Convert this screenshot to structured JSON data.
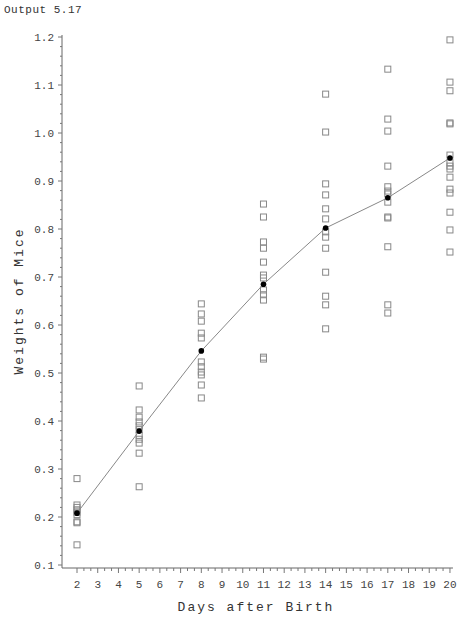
{
  "output_label": "Output 5.17",
  "chart_data": {
    "type": "scatter",
    "title": "",
    "xlabel": "Days after Birth",
    "ylabel": "Weights of Mice",
    "xlim": [
      2,
      20
    ],
    "ylim": [
      0.1,
      1.2
    ],
    "x_ticks": [
      2,
      3,
      4,
      5,
      6,
      7,
      8,
      9,
      10,
      11,
      12,
      13,
      14,
      15,
      16,
      17,
      18,
      19,
      20
    ],
    "y_ticks": [
      0.1,
      0.2,
      0.3,
      0.4,
      0.5,
      0.6,
      0.7,
      0.8,
      0.9,
      1.0,
      1.1,
      1.2
    ],
    "y_tick_labels": [
      "0.1",
      "0.2",
      "0.3",
      "0.4",
      "0.5",
      "0.6",
      "0.7",
      "0.8",
      "0.9",
      "1.0",
      "1.1",
      "1.2"
    ],
    "grid": false,
    "legend": null,
    "series": [
      {
        "name": "Individual weights",
        "marker": "open-square",
        "color": "#888888",
        "points": [
          {
            "x": 2,
            "y": [
              0.28,
              0.225,
              0.22,
              0.215,
              0.21,
              0.205,
              0.19,
              0.188,
              0.142
            ]
          },
          {
            "x": 5,
            "y": [
              0.473,
              0.423,
              0.408,
              0.398,
              0.39,
              0.382,
              0.37,
              0.362,
              0.354,
              0.333,
              0.263
            ]
          },
          {
            "x": 8,
            "y": [
              0.644,
              0.623,
              0.608,
              0.583,
              0.573,
              0.523,
              0.513,
              0.502,
              0.496,
              0.475,
              0.448
            ]
          },
          {
            "x": 11,
            "y": [
              0.852,
              0.825,
              0.773,
              0.76,
              0.731,
              0.704,
              0.698,
              0.673,
              0.663,
              0.652,
              0.533,
              0.529
            ]
          },
          {
            "x": 14,
            "y": [
              1.081,
              1.002,
              0.894,
              0.871,
              0.842,
              0.821,
              0.794,
              0.783,
              0.76,
              0.71,
              0.66,
              0.642,
              0.592
            ]
          },
          {
            "x": 17,
            "y": [
              1.133,
              1.029,
              1.004,
              0.931,
              0.888,
              0.879,
              0.873,
              0.856,
              0.825,
              0.823,
              0.763,
              0.642,
              0.625
            ]
          },
          {
            "x": 20,
            "y": [
              1.194,
              1.106,
              1.088,
              1.021,
              1.019,
              0.954,
              0.938,
              0.931,
              0.925,
              0.908,
              0.883,
              0.875,
              0.835,
              0.798,
              0.752
            ]
          }
        ]
      },
      {
        "name": "Mean weight",
        "marker": "filled-circle",
        "color": "#000000",
        "line": true,
        "line_color": "#888888",
        "x": [
          2,
          5,
          8,
          11,
          14,
          17,
          20
        ],
        "y": [
          0.208,
          0.379,
          0.546,
          0.685,
          0.802,
          0.865,
          0.948
        ]
      }
    ]
  }
}
